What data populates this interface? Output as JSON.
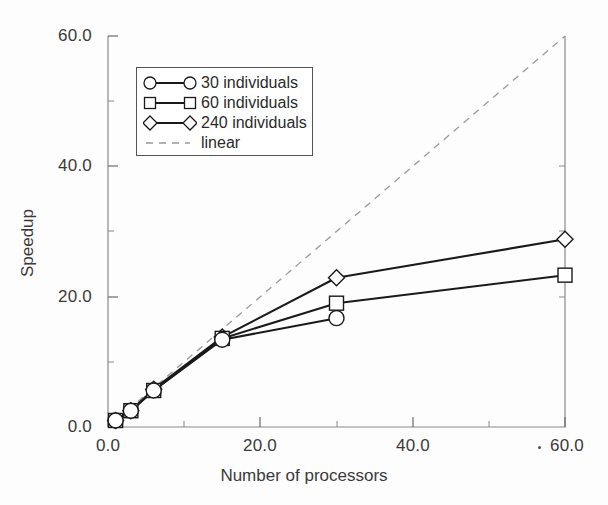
{
  "chart_data": {
    "type": "line",
    "title": "",
    "xlabel": "Number of processors",
    "ylabel": "Speedup",
    "xlim": [
      0,
      60
    ],
    "ylim": [
      0,
      60
    ],
    "xticks": [
      0,
      20,
      40,
      60
    ],
    "yticks": [
      0,
      20,
      40,
      60
    ],
    "xticklabels": [
      "0.0",
      "20.0",
      "40.0",
      "60.0"
    ],
    "yticklabels": [
      "0.0",
      "20.0",
      "40.0",
      "60.0"
    ],
    "xminorticks": [
      10,
      30,
      50
    ],
    "yminorticks": [
      10,
      30,
      50
    ],
    "grid": false,
    "legend_position": "upper left",
    "series": [
      {
        "name": "30 individuals",
        "marker": "circle",
        "linestyle": "solid",
        "color": "#1a1a1a",
        "x": [
          1,
          3,
          6,
          15,
          30
        ],
        "y": [
          1.0,
          2.5,
          5.6,
          13.4,
          16.7
        ]
      },
      {
        "name": "60 individuals",
        "marker": "square",
        "linestyle": "solid",
        "color": "#1a1a1a",
        "x": [
          1,
          3,
          6,
          15,
          30,
          60
        ],
        "y": [
          1.0,
          2.5,
          5.6,
          13.6,
          19.0,
          23.3
        ]
      },
      {
        "name": "240 individuals",
        "marker": "diamond",
        "linestyle": "solid",
        "color": "#1a1a1a",
        "x": [
          1,
          3,
          6,
          15,
          30,
          60
        ],
        "y": [
          1.0,
          2.5,
          5.8,
          13.8,
          22.9,
          28.8
        ]
      },
      {
        "name": "linear",
        "marker": "none",
        "linestyle": "dashed",
        "color": "#9a9a9a",
        "x": [
          0,
          60
        ],
        "y": [
          0,
          60
        ]
      }
    ]
  },
  "axes": {
    "x_title": "Number of processors",
    "y_title": "Speedup",
    "x_tick_labels": [
      "0.0",
      "20.0",
      "40.0",
      "60.0"
    ],
    "y_tick_labels": [
      "0.0",
      "20.0",
      "40.0",
      "60.0"
    ]
  },
  "legend": {
    "entries": [
      {
        "label": "30 individuals",
        "marker": "circle",
        "style": "solid"
      },
      {
        "label": "60 individuals",
        "marker": "square",
        "style": "solid"
      },
      {
        "label": "240 individuals",
        "marker": "diamond",
        "style": "solid"
      },
      {
        "label": "linear",
        "marker": "none",
        "style": "dashed"
      }
    ]
  },
  "colors": {
    "series_line": "#1a1a1a",
    "reference_line": "#9a9a9a",
    "axis": "#6b6b6b",
    "text": "#3a3a3a",
    "background": "#fdfdfd"
  }
}
